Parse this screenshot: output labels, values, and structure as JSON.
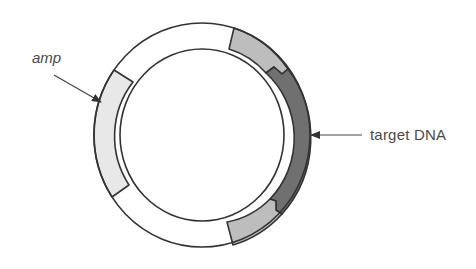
{
  "diagram": {
    "title": "",
    "type": "plasmid map",
    "labels": {
      "amp": "amp",
      "target_dna": "target DNA"
    },
    "segments": [
      {
        "name": "amp",
        "color": "#e8e8e8"
      },
      {
        "name": "vector-upper",
        "color": "#ffffff"
      },
      {
        "name": "flank-top",
        "color": "#bdbdbd"
      },
      {
        "name": "target DNA",
        "color": "#707070"
      },
      {
        "name": "flank-bottom",
        "color": "#bdbdbd"
      },
      {
        "name": "vector-lower",
        "color": "#ffffff"
      }
    ],
    "outline_color": "#333333"
  }
}
